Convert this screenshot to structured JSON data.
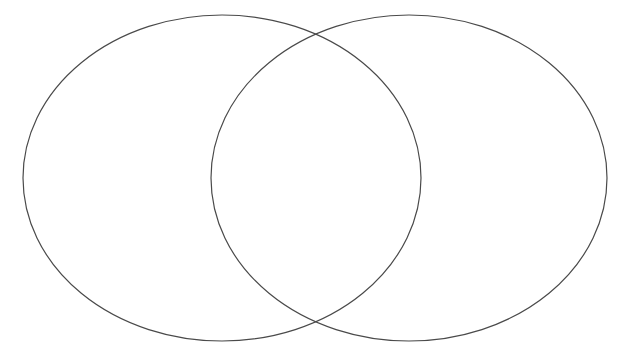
{
  "canvas": {
    "width": 627,
    "height": 357,
    "background_color": "#ffffff"
  },
  "diagram": {
    "type": "venn-two-set",
    "title": "",
    "stroke_color": "#4a4a4a",
    "stroke_width": 1.2,
    "fill_color": "none",
    "left_circle": {
      "name": "left-set",
      "label": "",
      "center_x": 222,
      "center_y": 178,
      "radius_x": 199,
      "radius_y": 163
    },
    "right_circle": {
      "name": "right-set",
      "label": "",
      "center_x": 409,
      "center_y": 178,
      "radius_x": 198,
      "radius_y": 163
    },
    "intersections": [
      {
        "x": 318,
        "y": 33
      },
      {
        "x": 318,
        "y": 324
      }
    ],
    "regions": {
      "left_only_label": "",
      "overlap_label": "",
      "right_only_label": ""
    }
  }
}
